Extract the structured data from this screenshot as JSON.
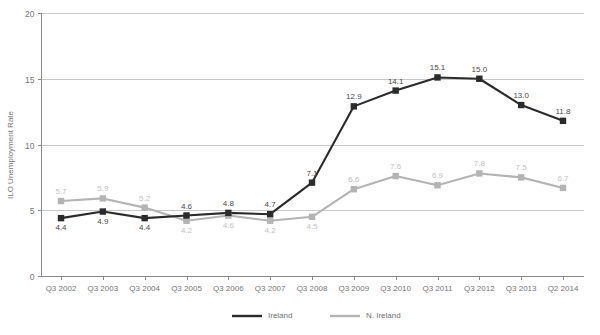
{
  "chart_data": {
    "type": "line",
    "title": "",
    "xlabel": "",
    "ylabel": "ILO Unemployment Rate",
    "ylim": [
      0,
      20
    ],
    "yticks": [
      0,
      5,
      10,
      15,
      20
    ],
    "grid": true,
    "legend_position": "bottom-center",
    "categories": [
      "Q3 2002",
      "Q3 2003",
      "Q3 2004",
      "Q3 2005",
      "Q3 2006",
      "Q3 2007",
      "Q3 2008",
      "Q3 2009",
      "Q3 2010",
      "Q3 2011",
      "Q3 2012",
      "Q3 2013",
      "Q2 2014"
    ],
    "series": [
      {
        "name": "Ireland",
        "color": "#2b2b2b",
        "values": [
          4.4,
          4.9,
          4.4,
          4.6,
          4.8,
          4.7,
          7.1,
          12.9,
          14.1,
          15.1,
          15.0,
          13.0,
          11.8
        ],
        "labels": [
          "4.4",
          "4.9",
          "4.4",
          "4.6",
          "4.8",
          "4.7",
          "7.1",
          "12.9",
          "14.1",
          "15.1",
          "15.0",
          "13.0",
          "11.8"
        ],
        "label_side": [
          "below",
          "below",
          "below",
          "above",
          "above",
          "above",
          "above",
          "above",
          "above",
          "above",
          "above",
          "above",
          "above"
        ]
      },
      {
        "name": "N. Ireland",
        "color": "#b4b4b4",
        "values": [
          5.7,
          5.9,
          5.2,
          4.2,
          4.6,
          4.2,
          4.5,
          6.6,
          7.6,
          6.9,
          7.8,
          7.5,
          6.7
        ],
        "labels": [
          "5.7",
          "5.9",
          "5.2",
          "4.2",
          "4.6",
          "4.2",
          "4.5",
          "6.6",
          "7.6",
          "6.9",
          "7.8",
          "7.5",
          "6.7"
        ],
        "label_side": [
          "above",
          "above",
          "above",
          "below",
          "below",
          "below",
          "below",
          "above",
          "above",
          "above",
          "above",
          "above",
          "above"
        ]
      }
    ],
    "legend": [
      {
        "label": "Ireland",
        "color": "#2b2b2b"
      },
      {
        "label": "N. Ireland",
        "color": "#b4b4b4"
      }
    ]
  }
}
